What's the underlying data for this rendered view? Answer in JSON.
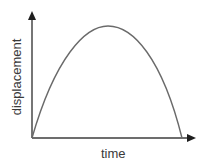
{
  "diagram": {
    "type": "motion-graph",
    "title": "",
    "x_axis": {
      "label": "time",
      "arrow": true
    },
    "y_axis": {
      "label": "displacement",
      "arrow": true
    },
    "curve": {
      "shape": "inverted-parabola",
      "description": "Displacement rises from zero to a maximum then returns to zero",
      "start": {
        "x": 0,
        "y": 0
      },
      "peak": {
        "x": 0.5,
        "y": 1
      },
      "end": {
        "x": 1,
        "y": 0
      }
    },
    "colors": {
      "axis": "#3c3c3c",
      "curve": "#6a6a6a",
      "text": "#3a3a3a",
      "background": "#ffffff"
    }
  }
}
